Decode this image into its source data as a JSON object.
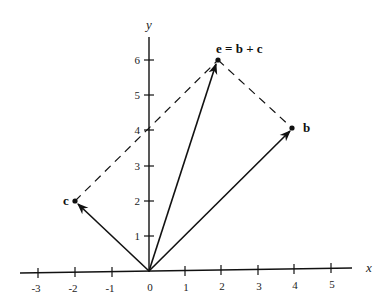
{
  "diagram": {
    "type": "vector-addition",
    "axes": {
      "x_label": "x",
      "y_label": "y",
      "x_ticks": [
        "-3",
        "-2",
        "-1",
        "0",
        "1",
        "2",
        "3",
        "4",
        "5"
      ],
      "y_ticks": [
        "1",
        "2",
        "3",
        "4",
        "5",
        "6"
      ]
    },
    "vectors": [
      {
        "name": "b",
        "label": "b",
        "x": 4,
        "y": 4
      },
      {
        "name": "c",
        "label": "c",
        "x": -2,
        "y": 2
      },
      {
        "name": "e",
        "label": "e = b + c",
        "x": 2,
        "y": 6
      }
    ],
    "colors": {
      "ink": "#111111",
      "background": "#ffffff"
    }
  }
}
